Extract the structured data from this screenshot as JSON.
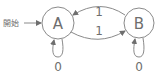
{
  "diagram": {
    "type": "state-machine",
    "start_label": "開始",
    "states": [
      {
        "id": "A",
        "label": "A",
        "cx": 58,
        "cy": 23,
        "r": 16,
        "initial": true
      },
      {
        "id": "B",
        "label": "B",
        "cx": 139,
        "cy": 23,
        "r": 15,
        "initial": false
      }
    ],
    "transitions": [
      {
        "from": "A",
        "to": "A",
        "label": "0"
      },
      {
        "from": "B",
        "to": "B",
        "label": "0"
      },
      {
        "from": "A",
        "to": "B",
        "label": "1"
      },
      {
        "from": "B",
        "to": "A",
        "label": "1"
      }
    ],
    "labels": {
      "state_a": "A",
      "state_b": "B",
      "b_to_a": "1",
      "a_to_b": "1",
      "loop_a": "0",
      "loop_b": "0"
    },
    "colors": {
      "stroke": "#8a8a8a",
      "text": "#6e6e6e",
      "background": "#ffffff"
    }
  }
}
